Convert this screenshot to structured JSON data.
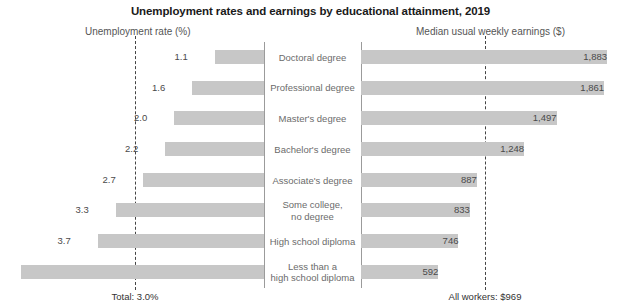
{
  "title": "Unemployment rates and earnings by educational attainment, 2019",
  "axes": {
    "left_label": "Unemployment rate (%)",
    "right_label": "Median usual weekly earnings ($)"
  },
  "footnotes": {
    "left": "Total: 3.0%",
    "right": "All workers: $969"
  },
  "chart_data": {
    "type": "bar",
    "title": "Unemployment rates and earnings by educational attainment, 2019",
    "orientation": "horizontal-diverging",
    "categories": [
      "Doctoral degree",
      "Professional degree",
      "Master's degree",
      "Bachelor's degree",
      "Associate's degree",
      "Some college,\nno degree",
      "High school diploma",
      "Less than a\nhigh school diploma"
    ],
    "series": [
      {
        "name": "Unemployment rate (%)",
        "side": "left",
        "xlabel": "Unemployment rate (%)",
        "values": [
          1.1,
          1.6,
          2.0,
          2.2,
          2.7,
          3.3,
          3.7,
          5.4
        ],
        "labels": [
          "1.1",
          "1.6",
          "2.0",
          "2.2",
          "2.7",
          "3.3",
          "3.7",
          "5.4"
        ],
        "xlim": [
          0,
          5.4
        ],
        "reference_line": {
          "value": 3.0,
          "label": "Total: 3.0%"
        }
      },
      {
        "name": "Median usual weekly earnings ($)",
        "side": "right",
        "xlabel": "Median usual weekly earnings ($)",
        "values": [
          1883,
          1861,
          1497,
          1248,
          887,
          833,
          746,
          592
        ],
        "labels": [
          "1,883",
          "1,861",
          "1,497",
          "1,248",
          "887",
          "833",
          "746",
          "592"
        ],
        "xlim": [
          0,
          1883
        ],
        "reference_line": {
          "value": 969,
          "label": "All workers: $969"
        }
      }
    ],
    "grid": false,
    "legend": "none",
    "colors": {
      "bar": "#c7c7c7",
      "reference_line": "#444444",
      "axis": "#9b9b9b"
    }
  }
}
